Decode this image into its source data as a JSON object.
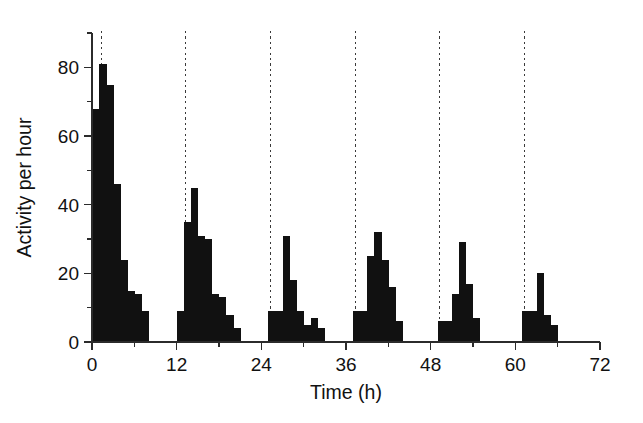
{
  "chart_data": {
    "type": "bar",
    "title": "",
    "subtitle": "",
    "xlabel": "Time (h)",
    "ylabel": "Activity per hour",
    "xlim": [
      0,
      72
    ],
    "ylim": [
      0,
      90
    ],
    "xticks": [
      0,
      12,
      24,
      36,
      48,
      60,
      72
    ],
    "xticklabels": [
      "0",
      "12",
      "24",
      "36",
      "48",
      "60",
      "72"
    ],
    "xminorticks": [
      6,
      18,
      30,
      42,
      54,
      66
    ],
    "yticks": [
      0,
      20,
      40,
      60,
      80
    ],
    "yticklabels": [
      "0",
      "20",
      "40",
      "60",
      "80"
    ],
    "yminorticks": [
      10,
      30,
      50,
      70,
      90
    ],
    "grid": false,
    "legend": null,
    "bar_width_hours": 1,
    "bar_color": "#111111",
    "annotations": {
      "marker_lines": {
        "label": "dashed vertical reference lines",
        "x_values": [
          1.3,
          13.3,
          25.3,
          37.3,
          49.3,
          61.3
        ],
        "color": "#3a3a3a",
        "style": "dashed"
      }
    },
    "x": [
      0,
      1,
      2,
      3,
      4,
      5,
      6,
      7,
      12,
      13,
      14,
      15,
      16,
      17,
      18,
      19,
      20,
      25,
      26,
      27,
      28,
      29,
      30,
      31,
      32,
      37,
      38,
      39,
      40,
      41,
      42,
      43,
      49,
      50,
      51,
      52,
      53,
      54,
      61,
      62,
      63,
      64,
      65
    ],
    "values": [
      68,
      81,
      75,
      46,
      24,
      15,
      14,
      9,
      9,
      35,
      45,
      31,
      30,
      14,
      13,
      8,
      4,
      9,
      9,
      31,
      18,
      9,
      5,
      7,
      4,
      9,
      9,
      25,
      32,
      24,
      16,
      6,
      6,
      6,
      14,
      29,
      17,
      7,
      9,
      9,
      20,
      8,
      5
    ],
    "series": [
      {
        "name": "Activity per hour",
        "bursts": [
          {
            "start_hour": 0,
            "values": [
              68,
              81,
              75,
              46,
              24,
              15,
              14,
              9
            ]
          },
          {
            "start_hour": 12,
            "values": [
              9,
              35,
              45,
              31,
              30,
              14,
              13,
              8,
              4
            ]
          },
          {
            "start_hour": 25,
            "values": [
              9,
              9,
              31,
              18,
              9,
              5,
              7,
              4
            ]
          },
          {
            "start_hour": 37,
            "values": [
              9,
              9,
              25,
              32,
              24,
              16,
              6
            ]
          },
          {
            "start_hour": 49,
            "values": [
              6,
              6,
              14,
              29,
              17,
              7
            ]
          },
          {
            "start_hour": 61,
            "values": [
              9,
              9,
              20,
              8,
              5
            ]
          }
        ]
      }
    ]
  }
}
